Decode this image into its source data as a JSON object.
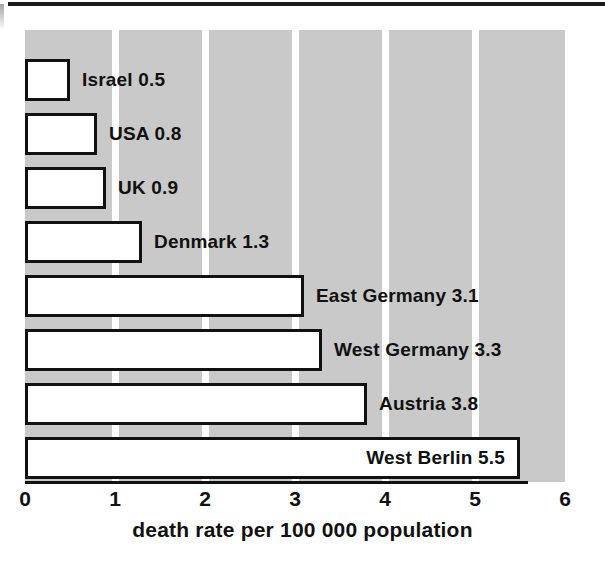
{
  "chart_data": {
    "type": "bar",
    "orientation": "horizontal",
    "title": "",
    "subtitle": "",
    "xlabel": "death rate per 100 000 population",
    "ylabel": "",
    "categories": [
      "Israel",
      "USA",
      "UK",
      "Denmark",
      "East Germany",
      "West Germany",
      "Austria",
      "West Berlin"
    ],
    "values": [
      0.5,
      0.8,
      0.9,
      1.3,
      3.1,
      3.3,
      3.8,
      5.5
    ],
    "data_labels": [
      "Israel 0.5",
      "USA 0.8",
      "UK 0.9",
      "Denmark 1.3",
      "East Germany 3.1",
      "West Germany 3.3",
      "Austria 3.8",
      "West Berlin 5.5"
    ],
    "label_placement": [
      "outside",
      "outside",
      "outside",
      "outside",
      "outside",
      "outside",
      "outside",
      "inside"
    ],
    "xlim": [
      0,
      6
    ],
    "xticks": [
      0,
      1,
      2,
      3,
      4,
      5,
      6
    ],
    "xtick_labels": [
      "0",
      "1",
      "2",
      "3",
      "4",
      "5",
      "6"
    ],
    "grid": "vertical-banded",
    "legend": "none",
    "colors": {
      "bar_fill": "#ffffff",
      "bar_outline": "#111111",
      "plot_band": "#c9c9c9",
      "background": "#ffffff",
      "text": "#111111"
    }
  },
  "axis": {
    "caption": "death rate per 100 000 population"
  }
}
